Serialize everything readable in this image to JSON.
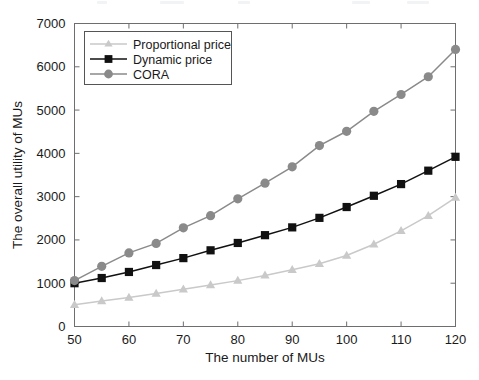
{
  "figure": {
    "background_color": "#ffffff",
    "axes_color": "#6e6e6e"
  },
  "chart_data": {
    "type": "line",
    "title": "",
    "xlabel": "The number of MUs",
    "ylabel": "The overall utility of MUs",
    "x": [
      50,
      55,
      60,
      65,
      70,
      75,
      80,
      85,
      90,
      95,
      100,
      105,
      110,
      115,
      120
    ],
    "xlim": [
      50,
      120
    ],
    "ylim": [
      0,
      7000
    ],
    "xticks": [
      50,
      60,
      70,
      80,
      90,
      100,
      110,
      120
    ],
    "yticks": [
      0,
      1000,
      2000,
      3000,
      4000,
      5000,
      6000,
      7000
    ],
    "xtick_labels": [
      "50",
      "60",
      "70",
      "80",
      "90",
      "100",
      "110",
      "120"
    ],
    "ytick_labels": [
      "0",
      "1000",
      "2000",
      "3000",
      "4000",
      "5000",
      "6000",
      "7000"
    ],
    "grid": false,
    "legend_position": "upper left",
    "series": [
      {
        "name": "Proportional price",
        "color": "#c9c9c9",
        "marker": "triangle",
        "values": [
          500,
          590,
          670,
          760,
          860,
          960,
          1060,
          1180,
          1310,
          1450,
          1640,
          1900,
          2210,
          2560,
          2980
        ]
      },
      {
        "name": "Dynamic price",
        "color": "#111111",
        "marker": "square",
        "values": [
          1000,
          1120,
          1260,
          1420,
          1580,
          1760,
          1930,
          2110,
          2290,
          2510,
          2760,
          3020,
          3290,
          3600,
          3920
        ]
      },
      {
        "name": "CORA",
        "color": "#8a8a8a",
        "marker": "circle",
        "values": [
          1060,
          1390,
          1700,
          1920,
          2280,
          2560,
          2950,
          3310,
          3690,
          4180,
          4510,
          4970,
          5360,
          5770,
          6400
        ]
      }
    ]
  },
  "legend": {
    "entries": [
      {
        "label": "Proportional price"
      },
      {
        "label": "Dynamic price"
      },
      {
        "label": "CORA"
      }
    ]
  }
}
